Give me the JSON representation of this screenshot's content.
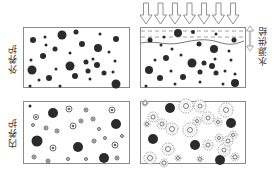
{
  "labels": {
    "external_curing": "外养护",
    "internal_curing": "内养护",
    "water_supply": "水源供给"
  },
  "colors": {
    "border": "#8a8a8a",
    "particle": "#2b2b2b",
    "halo": "#777777",
    "background": "#ffffff"
  },
  "panels": {
    "top_left": {
      "x": 23,
      "y": 27,
      "w": 106,
      "h": 60
    },
    "top_right": {
      "x": 140,
      "y": 27,
      "w": 105,
      "h": 60
    },
    "bottom_left": {
      "x": 23,
      "y": 101,
      "w": 106,
      "h": 62
    },
    "bottom_right": {
      "x": 140,
      "y": 101,
      "w": 105,
      "h": 62
    }
  },
  "arrows": {
    "count": 7,
    "x_start": 146,
    "spacing": 14.5,
    "y_top": 3,
    "y_bottom": 24
  },
  "particles": {
    "top_left": [
      [
        33,
        40,
        3
      ],
      [
        45,
        37,
        1.5
      ],
      [
        62,
        35,
        4.5
      ],
      [
        76,
        32,
        2.5
      ],
      [
        100,
        34,
        1.5
      ],
      [
        116,
        39,
        3
      ],
      [
        46,
        45,
        1.5
      ],
      [
        55,
        49,
        2.5
      ],
      [
        82,
        44,
        3
      ],
      [
        98,
        48,
        4
      ],
      [
        109,
        52,
        1.5
      ],
      [
        31,
        60,
        1.5
      ],
      [
        43,
        56,
        3
      ],
      [
        70,
        53,
        1.5
      ],
      [
        93,
        59,
        1.5
      ],
      [
        115,
        61,
        1.5
      ],
      [
        32,
        70,
        4.5
      ],
      [
        56,
        69,
        1.5
      ],
      [
        70,
        66,
        4.5
      ],
      [
        86,
        62,
        2.5
      ],
      [
        97,
        65,
        3
      ],
      [
        88,
        71,
        2.5
      ],
      [
        39,
        80,
        1.5
      ],
      [
        49,
        78,
        3
      ],
      [
        75,
        76,
        3
      ],
      [
        90,
        79,
        1.5
      ],
      [
        104,
        73,
        2.5
      ],
      [
        113,
        72,
        1.5
      ],
      [
        116,
        84,
        4.5
      ],
      [
        30,
        86,
        1.5
      ],
      [
        60,
        86,
        1.5
      ]
    ],
    "top_right": [
      [
        178,
        33,
        4
      ],
      [
        193,
        32,
        2
      ],
      [
        216,
        34,
        1.5
      ],
      [
        150,
        40,
        2.5
      ],
      [
        164,
        37,
        1.5
      ],
      [
        199,
        44,
        2.5
      ],
      [
        234,
        40,
        2.5
      ],
      [
        161,
        45,
        1.5
      ],
      [
        172,
        49,
        1.5
      ],
      [
        214,
        49,
        4
      ],
      [
        229,
        51,
        1.5
      ],
      [
        181,
        55,
        1.5
      ],
      [
        155,
        60,
        1.5
      ],
      [
        166,
        58,
        3
      ],
      [
        192,
        63,
        4.5
      ],
      [
        204,
        63,
        2.5
      ],
      [
        215,
        59,
        1.5
      ],
      [
        212,
        66,
        3
      ],
      [
        231,
        60,
        1.5
      ],
      [
        149,
        70,
        4
      ],
      [
        171,
        71,
        1.5
      ],
      [
        200,
        72,
        2.5
      ],
      [
        216,
        73,
        2.5
      ],
      [
        225,
        71,
        1.5
      ],
      [
        160,
        78,
        3
      ],
      [
        183,
        77,
        3
      ],
      [
        235,
        74,
        1.5
      ],
      [
        146,
        86,
        1.5
      ],
      [
        175,
        84,
        1.5
      ],
      [
        200,
        82,
        1.5
      ],
      [
        223,
        84,
        1.5
      ],
      [
        235,
        83,
        4
      ]
    ],
    "bottom_left_solid": [
      [
        30,
        106,
        1.5
      ],
      [
        53,
        113,
        5
      ],
      [
        116,
        124,
        5
      ],
      [
        37,
        141,
        5.5
      ],
      [
        78,
        147,
        5
      ],
      [
        104,
        158,
        5
      ]
    ],
    "bottom_left_hollow": [
      [
        69,
        109,
        3
      ],
      [
        86,
        110,
        2
      ],
      [
        112,
        110,
        3
      ],
      [
        36,
        117,
        2.5
      ],
      [
        33,
        125,
        1.5
      ],
      [
        81,
        121,
        2
      ],
      [
        93,
        119,
        2
      ],
      [
        46,
        128,
        2
      ],
      [
        57,
        131,
        2
      ],
      [
        73,
        126,
        3
      ],
      [
        99,
        129,
        1.5
      ],
      [
        94,
        141,
        2
      ],
      [
        105,
        138,
        1.5
      ],
      [
        122,
        136,
        1.5
      ],
      [
        53,
        148,
        3
      ],
      [
        115,
        145,
        3
      ],
      [
        34,
        157,
        2
      ],
      [
        48,
        161,
        2
      ],
      [
        68,
        159,
        1.5
      ],
      [
        86,
        159,
        1.5
      ],
      [
        117,
        158,
        2
      ]
    ],
    "bottom_right_solid": [
      [
        170,
        108,
        5
      ],
      [
        231,
        123,
        5
      ],
      [
        153,
        139,
        5
      ],
      [
        195,
        145,
        5
      ],
      [
        220,
        160,
        5
      ]
    ],
    "bottom_right_halo": [
      [
        145,
        103,
        3,
        2
      ],
      [
        153,
        117,
        5,
        2
      ],
      [
        147,
        124,
        3,
        1.5
      ],
      [
        186,
        106,
        7,
        2.5
      ],
      [
        200,
        106,
        6,
        2
      ],
      [
        226,
        110,
        7,
        2.5
      ],
      [
        197,
        121,
        4,
        1.5
      ],
      [
        208,
        118,
        6,
        2
      ],
      [
        218,
        122,
        4,
        1.5
      ],
      [
        162,
        124,
        5,
        2
      ],
      [
        172,
        129,
        6,
        2.5
      ],
      [
        190,
        130,
        7,
        2.5
      ],
      [
        219,
        138,
        4,
        1.5
      ],
      [
        233,
        135,
        4,
        1.5
      ],
      [
        208,
        145,
        5,
        2
      ],
      [
        224,
        150,
        6,
        2
      ],
      [
        228,
        141,
        5,
        2
      ],
      [
        168,
        149,
        6,
        2.5
      ],
      [
        150,
        158,
        6,
        2.5
      ],
      [
        164,
        163,
        4,
        2
      ],
      [
        178,
        158,
        3,
        1.5
      ],
      [
        200,
        159,
        3,
        1.5
      ],
      [
        235,
        157,
        4,
        2
      ]
    ]
  }
}
